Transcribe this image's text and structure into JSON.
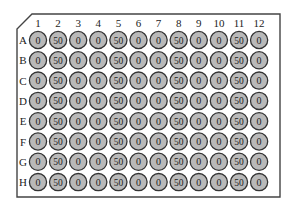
{
  "plate": {
    "columns": [
      "1",
      "2",
      "3",
      "4",
      "5",
      "6",
      "7",
      "8",
      "9",
      "10",
      "11",
      "12"
    ],
    "rows": [
      "A",
      "B",
      "C",
      "D",
      "E",
      "F",
      "G",
      "H"
    ],
    "values": [
      [
        "0",
        "50",
        "0",
        "0",
        "50",
        "0",
        "0",
        "50",
        "0",
        "0",
        "50",
        "0"
      ],
      [
        "0",
        "50",
        "0",
        "0",
        "50",
        "0",
        "0",
        "50",
        "0",
        "0",
        "50",
        "0"
      ],
      [
        "0",
        "50",
        "0",
        "0",
        "50",
        "0",
        "0",
        "50",
        "0",
        "0",
        "50",
        "0"
      ],
      [
        "0",
        "50",
        "0",
        "0",
        "50",
        "0",
        "0",
        "50",
        "0",
        "0",
        "50",
        "0"
      ],
      [
        "0",
        "50",
        "0",
        "0",
        "50",
        "0",
        "0",
        "50",
        "0",
        "0",
        "50",
        "0"
      ],
      [
        "0",
        "50",
        "0",
        "0",
        "50",
        "0",
        "0",
        "50",
        "0",
        "0",
        "50",
        "0"
      ],
      [
        "0",
        "50",
        "0",
        "0",
        "50",
        "0",
        "0",
        "50",
        "0",
        "0",
        "50",
        "0"
      ],
      [
        "0",
        "50",
        "0",
        "0",
        "50",
        "0",
        "0",
        "50",
        "0",
        "0",
        "50",
        "0"
      ]
    ],
    "colors": {
      "well_fill": "#b9b9b9",
      "well_stroke": "#333333",
      "outline": "#444444"
    }
  }
}
